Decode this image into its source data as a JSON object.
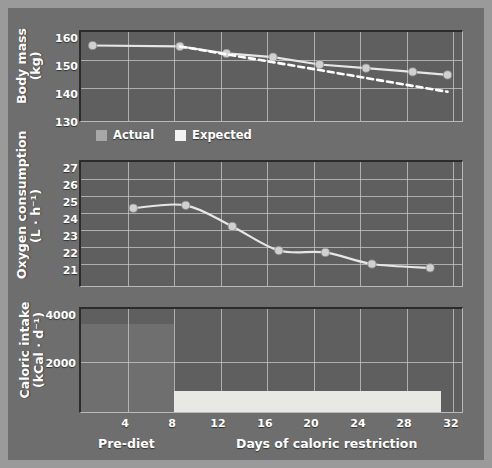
{
  "figure": {
    "background_color": "#6e6e6e",
    "plot_background_color": "#5f5f5f",
    "accent_marker_color": "#d0d0d0",
    "expected_line_color": "#ffffff",
    "grid_color": "#c9c9c9"
  },
  "axis": {
    "x_title_left": "Pre-diet",
    "x_title_right": "Days of caloric restriction",
    "x_ticks": [
      "4",
      "8",
      "12",
      "16",
      "20",
      "24",
      "28",
      "32"
    ],
    "x_tick_values": [
      4,
      8,
      12,
      16,
      20,
      24,
      28,
      32
    ],
    "x_min": 0,
    "x_max": 33
  },
  "legend": {
    "entries": [
      {
        "label": "Actual",
        "swatch": "actual"
      },
      {
        "label": "Expected",
        "swatch": "expected"
      }
    ]
  },
  "chart_data": [
    {
      "type": "line",
      "id": "body-mass",
      "title": "",
      "xlabel": "Days of caloric restriction",
      "ylabel": "Body mass (kg)",
      "ylabel_line1": "Body mass",
      "ylabel_line2": "(kg)",
      "ylim": [
        130,
        160
      ],
      "yticks": [
        "130",
        "140",
        "150",
        "160"
      ],
      "ytick_values": [
        130,
        140,
        150,
        160
      ],
      "xlim": [
        0,
        33
      ],
      "grid": true,
      "series": [
        {
          "name": "Actual",
          "color": "#e6e6e6",
          "style": "solid",
          "x": [
            1,
            8.5,
            12.5,
            16.5,
            20.5,
            24.5,
            28.5,
            31.5
          ],
          "values": [
            155.6,
            155.3,
            153.0,
            151.8,
            149.4,
            148.2,
            147.0,
            146.0
          ]
        },
        {
          "name": "Expected",
          "color": "#ffffff",
          "style": "dashed",
          "x": [
            8.5,
            31.5
          ],
          "values": [
            155.3,
            140.5
          ]
        }
      ]
    },
    {
      "type": "line",
      "id": "oxygen-consumption",
      "title": "",
      "xlabel": "Days of caloric restriction",
      "ylabel": "Oxygen consumption (L·h⁻¹)",
      "ylabel_line1": "Oxygen consumption",
      "ylabel_line2": "(L · h⁻¹)",
      "ylim": [
        20.4,
        27
      ],
      "yticks": [
        "21",
        "22",
        "23",
        "24",
        "25",
        "26",
        "27"
      ],
      "ytick_values": [
        21,
        22,
        23,
        24,
        25,
        26,
        27
      ],
      "xlim": [
        0,
        33
      ],
      "grid": true,
      "series": [
        {
          "name": "Actual",
          "color": "#e6e6e6",
          "style": "solid",
          "x": [
            4.5,
            9,
            13,
            17,
            21,
            25,
            30
          ],
          "values": [
            24.6,
            24.75,
            23.65,
            22.4,
            22.3,
            21.7,
            21.5
          ]
        }
      ]
    },
    {
      "type": "bar",
      "id": "caloric-intake",
      "title": "",
      "xlabel": "Days of caloric restriction",
      "ylabel": "Caloric intake (kCal·d⁻¹)",
      "ylabel_line1": "Caloric intake",
      "ylabel_line2": "(kCal · d⁻¹)",
      "ylim": [
        0,
        4000
      ],
      "yticks": [
        "2000",
        "4000"
      ],
      "ytick_values": [
        2000,
        4000
      ],
      "xlim": [
        0,
        33
      ],
      "grid": true,
      "bars": [
        {
          "name": "Pre-diet intake",
          "x_start": 0,
          "x_end": 8,
          "value": 3320,
          "color": "#6f6f6f"
        },
        {
          "name": "Restricted intake",
          "x_start": 8,
          "x_end": 31,
          "value": 800,
          "color": "#e8e8e4"
        }
      ]
    }
  ]
}
